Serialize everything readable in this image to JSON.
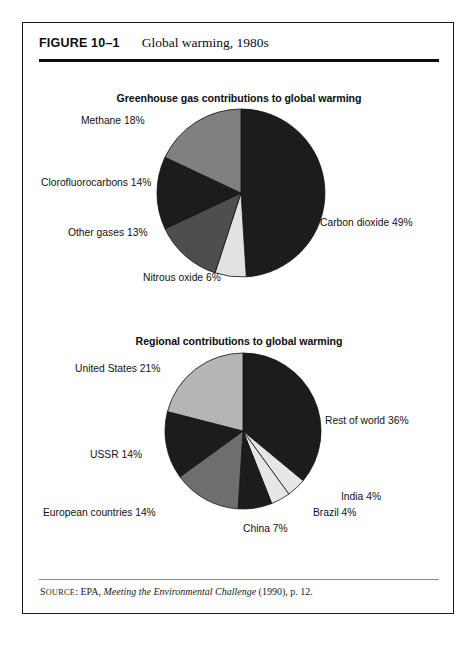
{
  "figure": {
    "number": "FIGURE 10–1",
    "title": "Global warming, 1980s"
  },
  "source": {
    "label": "Source",
    "label_cap": "S",
    "label_rest": "OURCE",
    "prefix": ": EPA, ",
    "italic_title": "Meeting the Environmental Challenge",
    "suffix": " (1990), p. 12."
  },
  "charts": [
    {
      "id": "greenhouse",
      "title": "Greenhouse gas contributions to global warming",
      "labels": [
        {
          "text": "Methane 18%",
          "x": 58,
          "y": 40
        },
        {
          "text": "Clorofluorocarbons 14%",
          "x": 18,
          "y": 102
        },
        {
          "text": "Other gases 13%",
          "x": 45,
          "y": 152
        },
        {
          "text": "Carbon dioxide 49%",
          "x": 297,
          "y": 142
        },
        {
          "text": "Nitrous oxide 6%",
          "x": 120,
          "y": 197
        }
      ]
    },
    {
      "id": "regional",
      "title": "Regional contributions to global warming",
      "labels": [
        {
          "text": "United States 21%",
          "x": 52,
          "y": 40
        },
        {
          "text": "USSR 14%",
          "x": 67,
          "y": 126
        },
        {
          "text": "European countries 14%",
          "x": 20,
          "y": 184
        },
        {
          "text": "Rest of world 36%",
          "x": 302,
          "y": 92
        },
        {
          "text": "India 4%",
          "x": 318,
          "y": 168
        },
        {
          "text": "Brazil 4%",
          "x": 290,
          "y": 184
        },
        {
          "text": "China 7%",
          "x": 220,
          "y": 200
        }
      ]
    }
  ],
  "chart_data": [
    {
      "type": "pie",
      "title": "Greenhouse gas contributions to global warming",
      "categories": [
        "Carbon dioxide",
        "Nitrous oxide",
        "Other gases",
        "Clorofluorocarbons",
        "Methane"
      ],
      "values": [
        49,
        6,
        13,
        14,
        18
      ],
      "labels": [
        "Carbon dioxide 49%",
        "Nitrous oxide 6%",
        "Other gases 13%",
        "Clorofluorocarbons 14%",
        "Methane 18%"
      ],
      "unit": "percent",
      "colors": [
        "#1c1c1c",
        "#e2e2e2",
        "#4e4e4e",
        "#1c1c1c",
        "#808080"
      ],
      "start_angle_deg": 0,
      "direction": "clockwise",
      "legend": "none",
      "xlabel": "",
      "ylabel": ""
    },
    {
      "type": "pie",
      "title": "Regional contributions to global warming",
      "categories": [
        "Rest of world",
        "India",
        "Brazil",
        "China",
        "European countries",
        "USSR",
        "United States"
      ],
      "values": [
        36,
        4,
        4,
        7,
        14,
        14,
        21
      ],
      "labels": [
        "Rest of world 36%",
        "India 4%",
        "Brazil 4%",
        "China 7%",
        "European countries 14%",
        "USSR 14%",
        "United States 21%"
      ],
      "unit": "percent",
      "colors": [
        "#1c1c1c",
        "#e6e6e6",
        "#e6e6e6",
        "#1c1c1c",
        "#6e6e6e",
        "#1c1c1c",
        "#b5b5b5"
      ],
      "start_angle_deg": 0,
      "direction": "clockwise",
      "legend": "none",
      "xlabel": "",
      "ylabel": ""
    }
  ]
}
